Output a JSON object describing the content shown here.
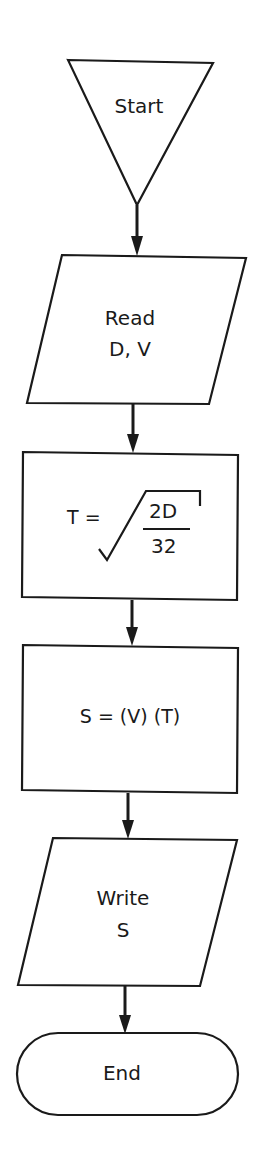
{
  "diagram": {
    "type": "flowchart",
    "stroke_color": "#1a1a1a",
    "background": "#ffffff",
    "nodes": [
      {
        "id": "start",
        "shape": "inverted-triangle",
        "label": "Start"
      },
      {
        "id": "read",
        "shape": "parallelogram",
        "line1": "Read",
        "line2": "D, V"
      },
      {
        "id": "compute_t",
        "shape": "rectangle",
        "lhs": "T =",
        "numerator": "2D",
        "denominator": "32",
        "expression": "T = √(2D/32)"
      },
      {
        "id": "compute_s",
        "shape": "rectangle",
        "label": "S = (V) (T)"
      },
      {
        "id": "write",
        "shape": "parallelogram",
        "line1": "Write",
        "line2": "S"
      },
      {
        "id": "end",
        "shape": "terminal",
        "label": "End"
      }
    ],
    "edges": [
      {
        "from": "start",
        "to": "read"
      },
      {
        "from": "read",
        "to": "compute_t"
      },
      {
        "from": "compute_t",
        "to": "compute_s"
      },
      {
        "from": "compute_s",
        "to": "write"
      },
      {
        "from": "write",
        "to": "end"
      }
    ]
  }
}
